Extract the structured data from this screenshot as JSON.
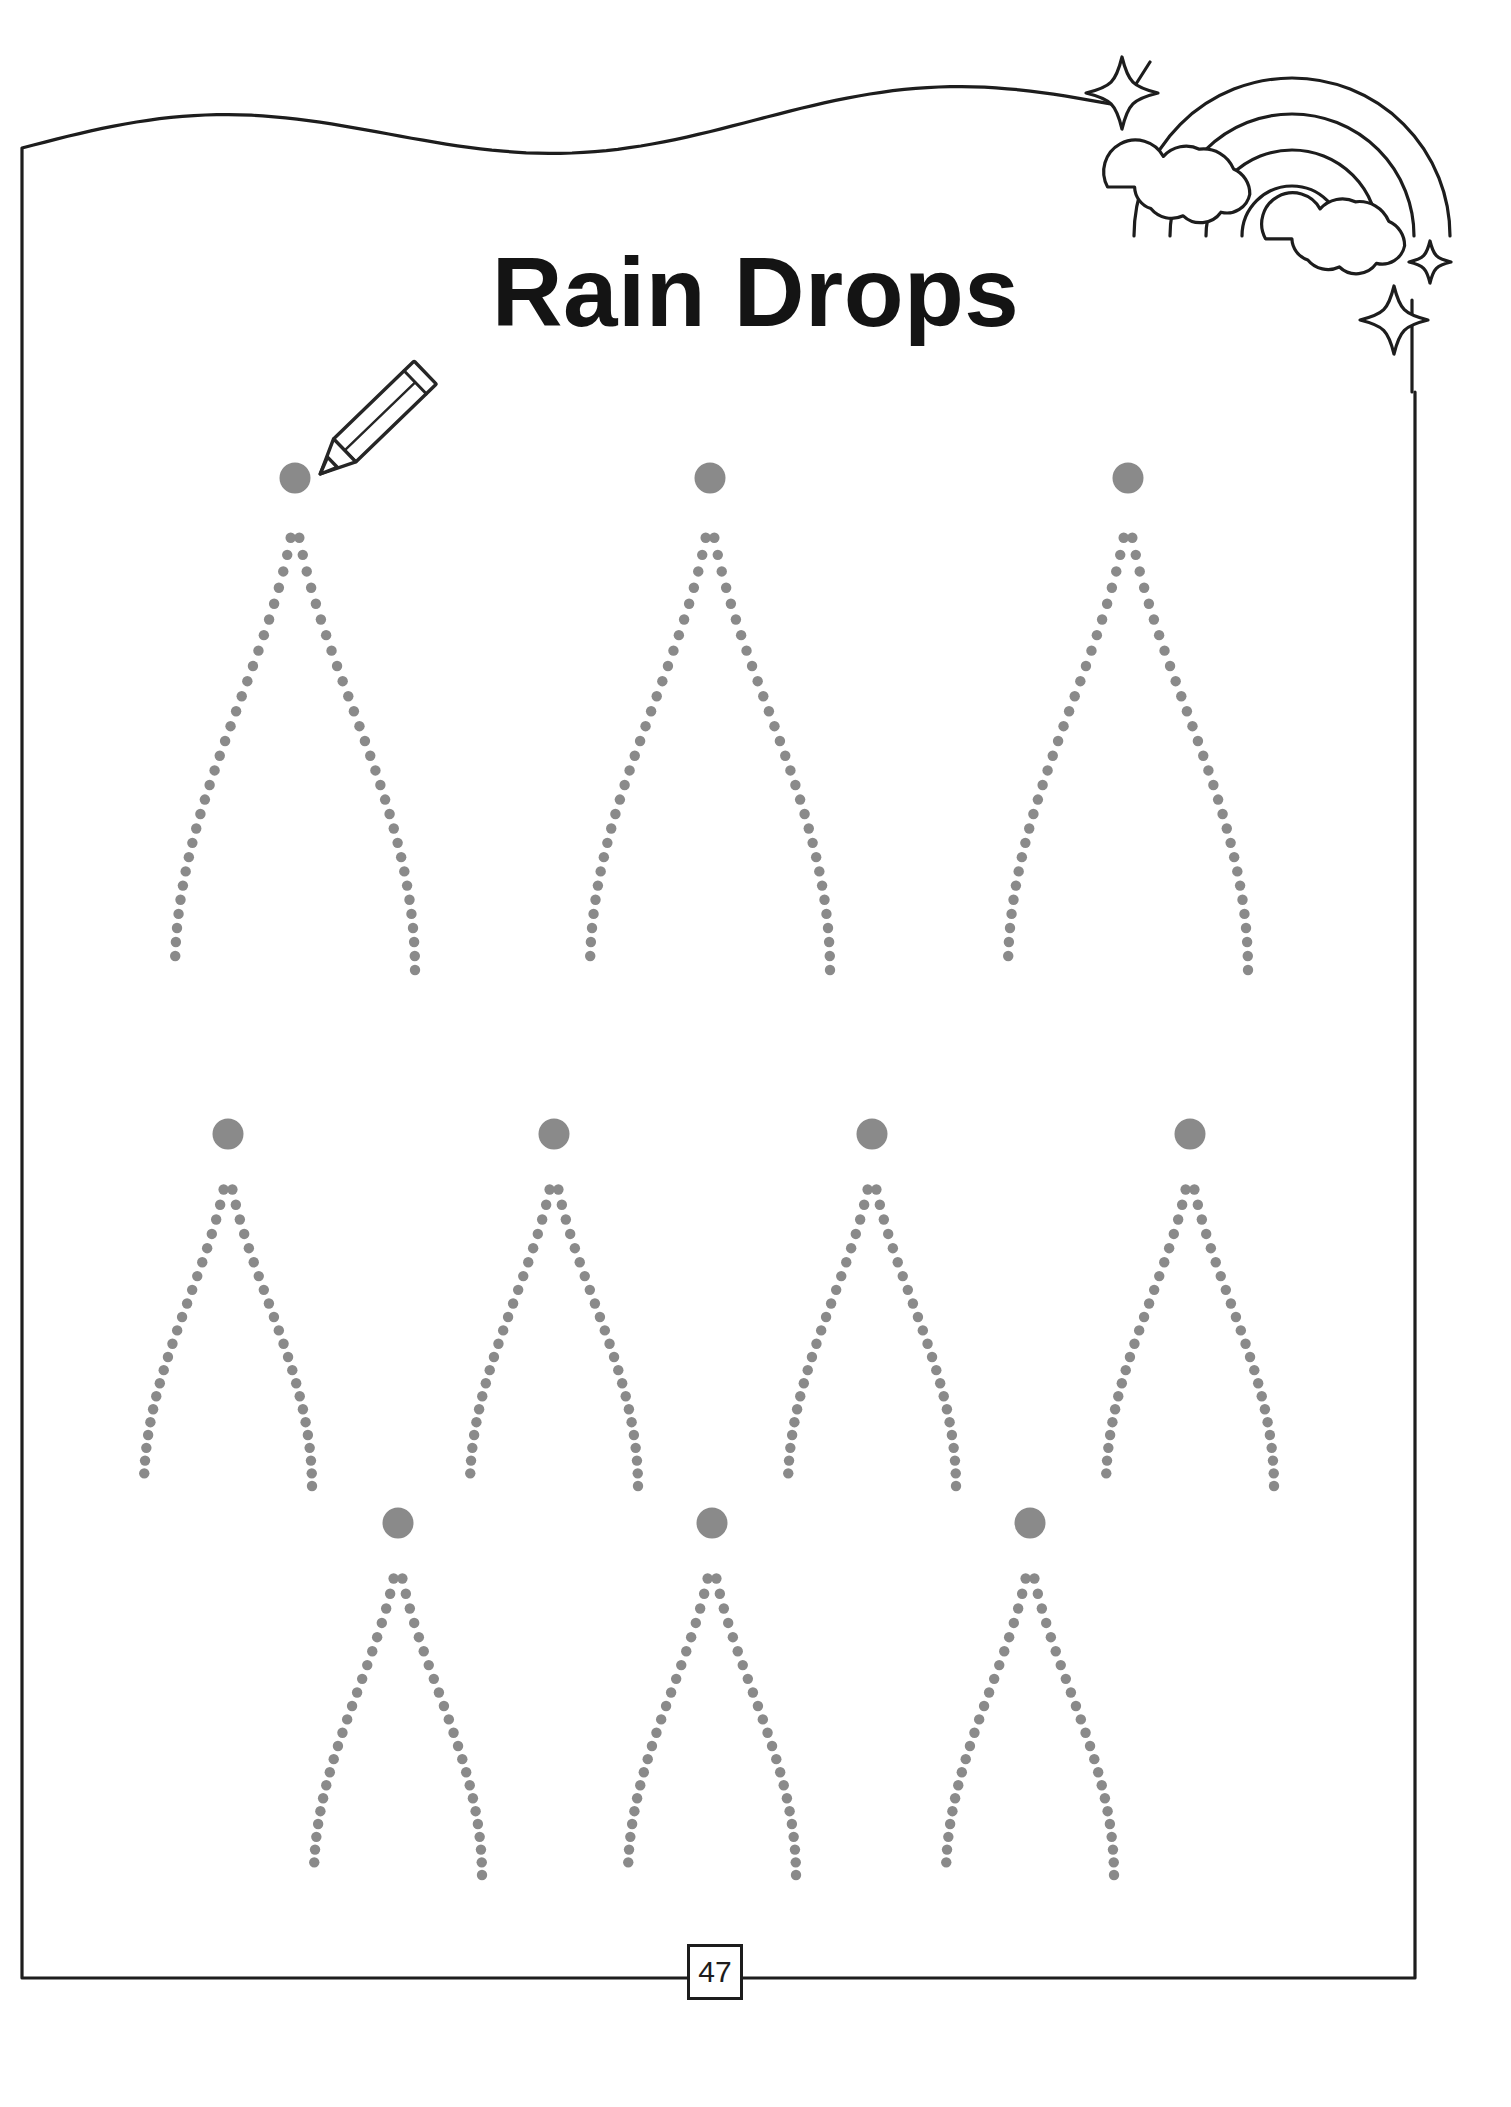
{
  "page": {
    "title": "Rain Drops",
    "page_number": "47",
    "width": 1511,
    "height": 2107,
    "background_color": "#ffffff",
    "border_color": "#1d1d1d",
    "activity_type": "tracing-worksheet",
    "instruction_implied": "Trace the dotted rain drops starting at the gray dot"
  },
  "colors": {
    "ink": "#1d1d1d",
    "trace_dot": "#8a8a8a",
    "start_dot": "#8a8a8a",
    "paper": "#ffffff"
  },
  "frame": {
    "left_x": 22,
    "right_x": 1415,
    "top_y": 148,
    "bottom_y": 1978,
    "top_edge_style": "wavy",
    "stroke_width": 3
  },
  "decorations": {
    "rainbow": {
      "name": "rainbow-with-clouds",
      "arc_count": 3,
      "cloud_count": 2,
      "sparkle_count": 3
    },
    "pencil": {
      "name": "pencil-icon",
      "x": 320,
      "y": 370,
      "rotation_deg": -45
    },
    "sparkles": [
      {
        "cx": 1122,
        "cy": 93,
        "size": 36,
        "name": "sparkle-large-top-left"
      },
      {
        "cx": 1394,
        "cy": 320,
        "size": 34,
        "name": "sparkle-large-bottom"
      },
      {
        "cx": 1430,
        "cy": 262,
        "size": 21,
        "name": "sparkle-small-bottom"
      }
    ]
  },
  "drops": {
    "dot_radius_trace": 5.2,
    "dot_radius_start": 15.5,
    "rows": [
      {
        "name": "row-large",
        "size": "large",
        "width": 240,
        "height": 470,
        "dot_count": 62,
        "items": [
          {
            "label": "drop-1",
            "cx": 295,
            "apex_y": 500
          },
          {
            "label": "drop-2",
            "cx": 710,
            "apex_y": 500
          },
          {
            "label": "drop-3",
            "cx": 1128,
            "apex_y": 500
          }
        ]
      },
      {
        "name": "row-medium-a",
        "size": "medium",
        "width": 168,
        "height": 330,
        "dot_count": 48,
        "items": [
          {
            "label": "drop-4",
            "cx": 228,
            "apex_y": 1156
          },
          {
            "label": "drop-5",
            "cx": 554,
            "apex_y": 1156
          },
          {
            "label": "drop-6",
            "cx": 872,
            "apex_y": 1156
          },
          {
            "label": "drop-7",
            "cx": 1190,
            "apex_y": 1156
          }
        ]
      },
      {
        "name": "row-medium-b",
        "size": "medium",
        "width": 168,
        "height": 330,
        "dot_count": 48,
        "items": [
          {
            "label": "drop-8",
            "cx": 398,
            "apex_y": 1545
          },
          {
            "label": "drop-9",
            "cx": 712,
            "apex_y": 1545
          },
          {
            "label": "drop-10",
            "cx": 1030,
            "apex_y": 1545
          }
        ]
      }
    ]
  }
}
